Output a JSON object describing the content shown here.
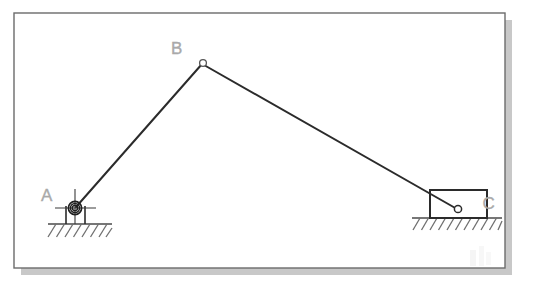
{
  "figure": {
    "type": "slider-crank-linkage",
    "canvas": {
      "width": 543,
      "height": 288,
      "background": "#ffffff"
    },
    "frame": {
      "name": "drawing-border",
      "x": 14,
      "y": 13,
      "width": 491,
      "height": 255,
      "stroke": "#6b6b6b",
      "stroke_width": 1.4,
      "fill": "#ffffff",
      "shadow_color": "#9a9a9a",
      "shadow_offset": 7
    },
    "colors": {
      "link_line": "#2b2b2b",
      "label_text": "#a9a9a9",
      "ground_line": "#4a4a4a",
      "hatch_line": "#6f6f6f",
      "bearing_stroke": "#1f1f1f",
      "centerline": "#3a3a3a",
      "block_stroke": "#2b2b2b",
      "joint_fill": "#ffffff",
      "watermark": "#ededed"
    },
    "joints": [
      {
        "id": "A",
        "label": "A",
        "kind": "fixed-pin-bearing-support",
        "x": 75,
        "y": 208,
        "label_x": 47,
        "label_y": 201,
        "circle_radii": [
          6.5,
          4.5,
          2.6
        ],
        "centerline_h": {
          "x1": 56,
          "x2": 96,
          "y": 208
        },
        "centerline_v": {
          "y1": 189,
          "y2": 224,
          "x": 75
        }
      },
      {
        "id": "B",
        "label": "B",
        "kind": "pin-joint",
        "x": 203,
        "y": 63,
        "label_x": 177,
        "label_y": 54,
        "radius": 3.4
      },
      {
        "id": "C",
        "label": "C",
        "kind": "slider-block-pin",
        "x": 458,
        "y": 209,
        "label_x": 489,
        "label_y": 209,
        "radius": 3.6
      }
    ],
    "links": [
      {
        "name": "link-AB",
        "from": "A",
        "to": "B",
        "x1": 76,
        "y1": 207,
        "x2": 202,
        "y2": 64,
        "stroke_width": 2.0
      },
      {
        "name": "link-BC",
        "from": "B",
        "to": "C",
        "x1": 204,
        "y1": 65,
        "x2": 457,
        "y2": 209,
        "stroke_width": 2.0
      }
    ],
    "slider_block": {
      "name": "slider-block-C",
      "x": 430,
      "y": 190,
      "width": 57,
      "height": 28,
      "stroke_width": 2.0
    },
    "bearing_legs": {
      "name": "bearing-pedestal-legs",
      "left_x": 66,
      "right_x": 85,
      "top_y": 208,
      "bottom_y": 224
    },
    "grounds": [
      {
        "name": "ground-support-A",
        "x1": 48,
        "x2": 112,
        "y": 224,
        "hatch_count": 8,
        "hatch_length": 13,
        "hatch_spacing": 8.5
      },
      {
        "name": "ground-support-C",
        "x1": 412,
        "x2": 502,
        "y": 218,
        "hatch_count": 11,
        "hatch_spacing": 8.5,
        "hatch_length": 12
      }
    ],
    "watermark": {
      "name": "page-watermark",
      "x": 470,
      "y": 250,
      "width": 22,
      "height": 18
    }
  }
}
